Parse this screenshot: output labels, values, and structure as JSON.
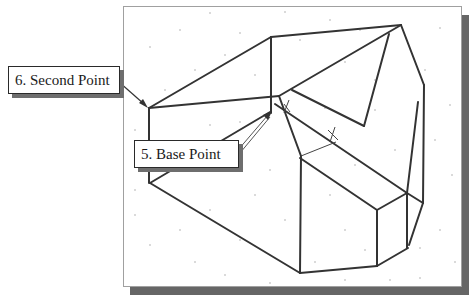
{
  "figure": {
    "colors": {
      "line": "#333333",
      "frame_border": "#a0a0a0",
      "frame_shadow": "#666666",
      "background": "#ffffff"
    },
    "callouts": [
      {
        "id": "second-point",
        "label": "6. Second Point"
      },
      {
        "id": "base-point",
        "label": "5. Base Point"
      }
    ]
  }
}
